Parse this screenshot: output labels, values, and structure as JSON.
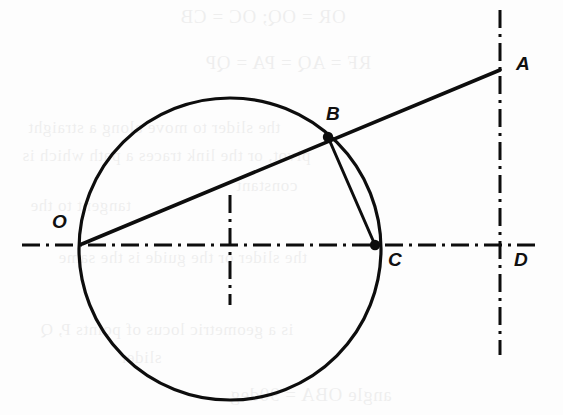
{
  "figure": {
    "kind": "geometry-diagram",
    "width": 563,
    "height": 415,
    "background_color": "#fdfdfd",
    "ink_color": "#0d0d0d",
    "description_title": "Circle through O and C with secant line O-B-A and chord B-C"
  },
  "labels": {
    "o": "O",
    "a": "A",
    "b": "B",
    "c": "C",
    "d": "D"
  },
  "points": [
    {
      "name": "O",
      "label": "O",
      "x": 82,
      "y": 244,
      "marker": "none",
      "label_x": 52,
      "label_y": 212
    },
    {
      "name": "A",
      "label": "A",
      "x": 500,
      "y": 70,
      "marker": "none",
      "label_x": 516,
      "label_y": 54
    },
    {
      "name": "B",
      "label": "B",
      "x": 328,
      "y": 137,
      "marker": "filled",
      "label_x": 326,
      "label_y": 104
    },
    {
      "name": "C",
      "label": "C",
      "x": 375,
      "y": 245,
      "marker": "filled",
      "label_x": 388,
      "label_y": 250
    },
    {
      "name": "D",
      "label": "D",
      "x": 500,
      "y": 245,
      "marker": "none",
      "label_x": 514,
      "label_y": 250
    }
  ],
  "circle": {
    "center_x": 230,
    "center_y": 249,
    "radius": 151,
    "stroke_width": 3.2
  },
  "segments": [
    {
      "name": "secant-O-A",
      "from": "O",
      "to": "A",
      "x1": 82,
      "y1": 244,
      "x2": 500,
      "y2": 70,
      "stroke_width": 3.6
    },
    {
      "name": "chord-B-C",
      "from": "B",
      "to": "C",
      "x1": 328,
      "y1": 137,
      "x2": 375,
      "y2": 245,
      "stroke_width": 3.0
    }
  ],
  "axes": [
    {
      "name": "horizontal-center-line",
      "orientation": "horizontal",
      "x1": 22,
      "y1": 245,
      "x2": 535,
      "y2": 245
    },
    {
      "name": "vertical-right-line",
      "orientation": "vertical",
      "x1": 500,
      "y1": 10,
      "x2": 500,
      "y2": 355
    },
    {
      "name": "vertical-center-tick",
      "orientation": "vertical",
      "x1": 230,
      "y1": 195,
      "x2": 230,
      "y2": 305
    }
  ],
  "axis_style": {
    "stroke_width": 3.0,
    "dash_pattern": "18 6 3 6"
  },
  "bleed_through_text": [
    {
      "text": "OR = OQ;    OC = CB",
      "x": 180,
      "y": 6,
      "size": "normal"
    },
    {
      "text": "RF = AQ = PA = QP",
      "x": 205,
      "y": 52,
      "size": "normal"
    },
    {
      "text": "the slider to move along a straight",
      "x": 28,
      "y": 118,
      "size": "small"
    },
    {
      "text": "pivot, or the link traces a path which is",
      "x": 22,
      "y": 146,
      "size": "small"
    },
    {
      "text": "constant",
      "x": 236,
      "y": 176,
      "size": "small"
    },
    {
      "text": "tangent to the",
      "x": 30,
      "y": 196,
      "size": "small"
    },
    {
      "text": "the slider or the guide is the same",
      "x": 58,
      "y": 248,
      "size": "small"
    },
    {
      "text": "is a geometric locus of points P, Q",
      "x": 40,
      "y": 320,
      "size": "small"
    },
    {
      "text": "slider",
      "x": 120,
      "y": 348,
      "size": "small"
    },
    {
      "text": "angle OBA = 90deg",
      "x": 230,
      "y": 384,
      "size": "normal"
    }
  ]
}
